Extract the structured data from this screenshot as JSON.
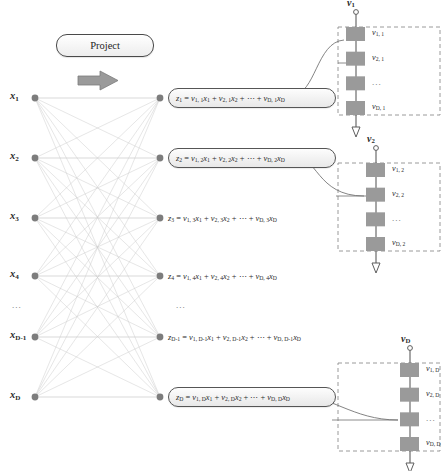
{
  "diagram": {
    "title_button": "Project",
    "arrow_icon": "right-arrow-icon",
    "ellipsis": "..."
  },
  "input_nodes": [
    {
      "label": "x",
      "sub": "1",
      "y": 98
    },
    {
      "label": "x",
      "sub": "2",
      "y": 158
    },
    {
      "label": "x",
      "sub": "3",
      "y": 218
    },
    {
      "label": "x",
      "sub": "4",
      "y": 276
    },
    {
      "label": "x",
      "sub": "D-1",
      "y": 337
    },
    {
      "label": "x",
      "sub": "D",
      "y": 397
    }
  ],
  "output_nodes": [
    {
      "boxed": true,
      "y": 98,
      "lhs_sub": "1",
      "terms": [
        {
          "coef_sub": "1, 1",
          "var_sub": "1"
        },
        {
          "coef_sub": "2, 1",
          "var_sub": "2"
        },
        {
          "coef_sub": "D, 1",
          "var_sub": "D"
        }
      ]
    },
    {
      "boxed": true,
      "y": 158,
      "lhs_sub": "2",
      "terms": [
        {
          "coef_sub": "1, 2",
          "var_sub": "1"
        },
        {
          "coef_sub": "2, 2",
          "var_sub": "2"
        },
        {
          "coef_sub": "D, 2",
          "var_sub": "D"
        }
      ]
    },
    {
      "boxed": false,
      "y": 218,
      "lhs_sub": "3",
      "terms": [
        {
          "coef_sub": "1, 3",
          "var_sub": "1"
        },
        {
          "coef_sub": "2, 3",
          "var_sub": "2"
        },
        {
          "coef_sub": "D, 3",
          "var_sub": "D"
        }
      ]
    },
    {
      "boxed": false,
      "y": 276,
      "lhs_sub": "4",
      "terms": [
        {
          "coef_sub": "1, 4",
          "var_sub": "1"
        },
        {
          "coef_sub": "2, 4",
          "var_sub": "2"
        },
        {
          "coef_sub": "D, 4",
          "var_sub": "D"
        }
      ]
    },
    {
      "boxed": false,
      "y": 337,
      "lhs_sub": "D-1",
      "terms": [
        {
          "coef_sub": "1, D-1",
          "var_sub": "1"
        },
        {
          "coef_sub": "2, D-1",
          "var_sub": "2"
        },
        {
          "coef_sub": "D, D-1",
          "var_sub": "D"
        }
      ]
    },
    {
      "boxed": true,
      "y": 397,
      "lhs_sub": "D",
      "terms": [
        {
          "coef_sub": "1, D",
          "var_sub": "1"
        },
        {
          "coef_sub": "2, D",
          "var_sub": "2"
        },
        {
          "coef_sub": "D, D",
          "var_sub": "D"
        }
      ]
    }
  ],
  "vector_panels": [
    {
      "name": "v1",
      "top_label_sub": "1",
      "box": {
        "x": 338,
        "y": 27,
        "w": 102,
        "h": 88
      },
      "bars_x": 346,
      "axis_x": 356,
      "entries": [
        {
          "sub": "1, 1"
        },
        {
          "sub": "2, 1"
        },
        {
          "sub": "",
          "is_dots": true
        },
        {
          "sub": "D, 1"
        }
      ]
    },
    {
      "name": "v2",
      "top_label_sub": "2",
      "box": {
        "x": 338,
        "y": 163,
        "w": 102,
        "h": 88
      },
      "bars_x": 366,
      "axis_x": 376,
      "entries": [
        {
          "sub": "1, 2"
        },
        {
          "sub": "2, 2"
        },
        {
          "sub": "",
          "is_dots": true
        },
        {
          "sub": "D, 2"
        }
      ]
    },
    {
      "name": "vD",
      "top_label_sub": "D",
      "box": {
        "x": 338,
        "y": 363,
        "w": 102,
        "h": 88
      },
      "bars_x": 400,
      "axis_x": 410,
      "entries": [
        {
          "sub": "1, D"
        },
        {
          "sub": "2, D"
        },
        {
          "sub": "",
          "is_dots": true
        },
        {
          "sub": "D, D"
        }
      ]
    }
  ],
  "symbols": {
    "equals": "=",
    "plus": "+",
    "cdots": "⋯",
    "z": "z",
    "v": "v",
    "x": "x"
  },
  "colors": {
    "node": "#7d7d7d",
    "edge": "#cccccc",
    "bar": "#9a9a9a",
    "dashed_box": "#8e8e8e",
    "arrow": "#9a9a9a",
    "text": "#2b2b2b",
    "connector": "#6e6e6e"
  }
}
